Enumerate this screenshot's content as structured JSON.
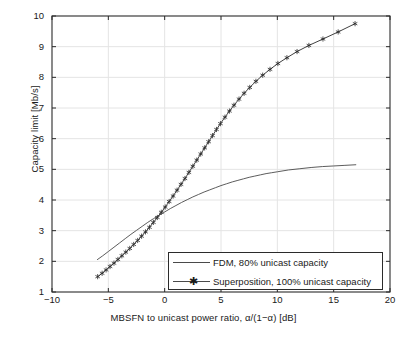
{
  "chart_data": {
    "type": "line",
    "title": "",
    "xlabel": "MBSFN to unicast power ratio, α/(1−α) [dB]",
    "ylabel": "Capacity limit [Mb/s]",
    "xlim": [
      -10,
      20
    ],
    "ylim": [
      1,
      10
    ],
    "xticks": [
      -10,
      -5,
      0,
      5,
      10,
      15,
      20
    ],
    "xtick_labels": [
      "−10",
      "−5",
      "0",
      "5",
      "10",
      "15",
      "20"
    ],
    "yticks": [
      1,
      2,
      3,
      4,
      5,
      6,
      7,
      8,
      9,
      10
    ],
    "ytick_labels": [
      "1",
      "2",
      "3",
      "4",
      "5",
      "6",
      "7",
      "8",
      "9",
      "10"
    ],
    "grid": true,
    "legend_position": "lower right",
    "series": [
      {
        "name": "FDM, 80% unicast capacity",
        "marker": "none",
        "color": "#4a4a4a",
        "points": [
          [
            -6.0,
            2.05
          ],
          [
            -5.5,
            2.18
          ],
          [
            -5.0,
            2.32
          ],
          [
            -4.5,
            2.46
          ],
          [
            -4.0,
            2.6
          ],
          [
            -3.5,
            2.74
          ],
          [
            -3.0,
            2.88
          ],
          [
            -2.5,
            3.01
          ],
          [
            -2.0,
            3.14
          ],
          [
            -1.5,
            3.27
          ],
          [
            -1.0,
            3.39
          ],
          [
            -0.5,
            3.5
          ],
          [
            0.0,
            3.61
          ],
          [
            0.5,
            3.72
          ],
          [
            1.0,
            3.82
          ],
          [
            1.5,
            3.92
          ],
          [
            2.0,
            4.01
          ],
          [
            2.5,
            4.1
          ],
          [
            3.0,
            4.18
          ],
          [
            3.5,
            4.26
          ],
          [
            4.0,
            4.33
          ],
          [
            4.5,
            4.4
          ],
          [
            5.0,
            4.47
          ],
          [
            5.5,
            4.53
          ],
          [
            6.0,
            4.59
          ],
          [
            6.5,
            4.64
          ],
          [
            7.0,
            4.69
          ],
          [
            7.5,
            4.74
          ],
          [
            8.0,
            4.78
          ],
          [
            8.5,
            4.82
          ],
          [
            9.0,
            4.86
          ],
          [
            9.5,
            4.89
          ],
          [
            10.0,
            4.92
          ],
          [
            11.0,
            4.98
          ],
          [
            12.0,
            5.02
          ],
          [
            13.0,
            5.06
          ],
          [
            14.0,
            5.09
          ],
          [
            15.0,
            5.11
          ],
          [
            16.0,
            5.13
          ],
          [
            17.0,
            5.15
          ]
        ]
      },
      {
        "name": "Superposition, 100% unicast capacity",
        "marker": "star",
        "color": "#2b2b2b",
        "points": [
          [
            -5.95,
            1.5
          ],
          [
            -5.55,
            1.61
          ],
          [
            -5.2,
            1.72
          ],
          [
            -4.85,
            1.83
          ],
          [
            -4.5,
            1.94
          ],
          [
            -4.15,
            2.06
          ],
          [
            -3.8,
            2.18
          ],
          [
            -3.45,
            2.3
          ],
          [
            -3.1,
            2.42
          ],
          [
            -2.75,
            2.55
          ],
          [
            -2.4,
            2.68
          ],
          [
            -2.05,
            2.82
          ],
          [
            -1.7,
            2.96
          ],
          [
            -1.35,
            3.11
          ],
          [
            -1.0,
            3.27
          ],
          [
            -0.65,
            3.43
          ],
          [
            -0.3,
            3.6
          ],
          [
            0.05,
            3.77
          ],
          [
            0.4,
            3.95
          ],
          [
            0.75,
            4.13
          ],
          [
            1.1,
            4.32
          ],
          [
            1.45,
            4.51
          ],
          [
            1.8,
            4.7
          ],
          [
            2.15,
            4.9
          ],
          [
            2.5,
            5.1
          ],
          [
            2.85,
            5.3
          ],
          [
            3.2,
            5.5
          ],
          [
            3.55,
            5.7
          ],
          [
            3.9,
            5.9
          ],
          [
            4.25,
            6.1
          ],
          [
            4.6,
            6.3
          ],
          [
            4.95,
            6.49
          ],
          [
            5.35,
            6.7
          ],
          [
            5.75,
            6.9
          ],
          [
            6.15,
            7.09
          ],
          [
            6.6,
            7.29
          ],
          [
            7.05,
            7.48
          ],
          [
            7.55,
            7.67
          ],
          [
            8.1,
            7.87
          ],
          [
            8.7,
            8.07
          ],
          [
            9.35,
            8.26
          ],
          [
            10.05,
            8.45
          ],
          [
            10.85,
            8.64
          ],
          [
            11.75,
            8.84
          ],
          [
            12.8,
            9.04
          ],
          [
            14.05,
            9.25
          ],
          [
            15.4,
            9.48
          ],
          [
            16.9,
            9.75
          ]
        ]
      }
    ]
  },
  "legend": {
    "entries": [
      {
        "label": "FDM, 80% unicast capacity",
        "marker": "none"
      },
      {
        "label": "Superposition, 100% unicast capacity",
        "marker": "star"
      }
    ]
  },
  "colors": {
    "axis": "#2b2b2b",
    "grid": "#e4e4e4",
    "fdm_line": "#4a4a4a",
    "superposition_line": "#2b2b2b",
    "background": "#ffffff"
  }
}
